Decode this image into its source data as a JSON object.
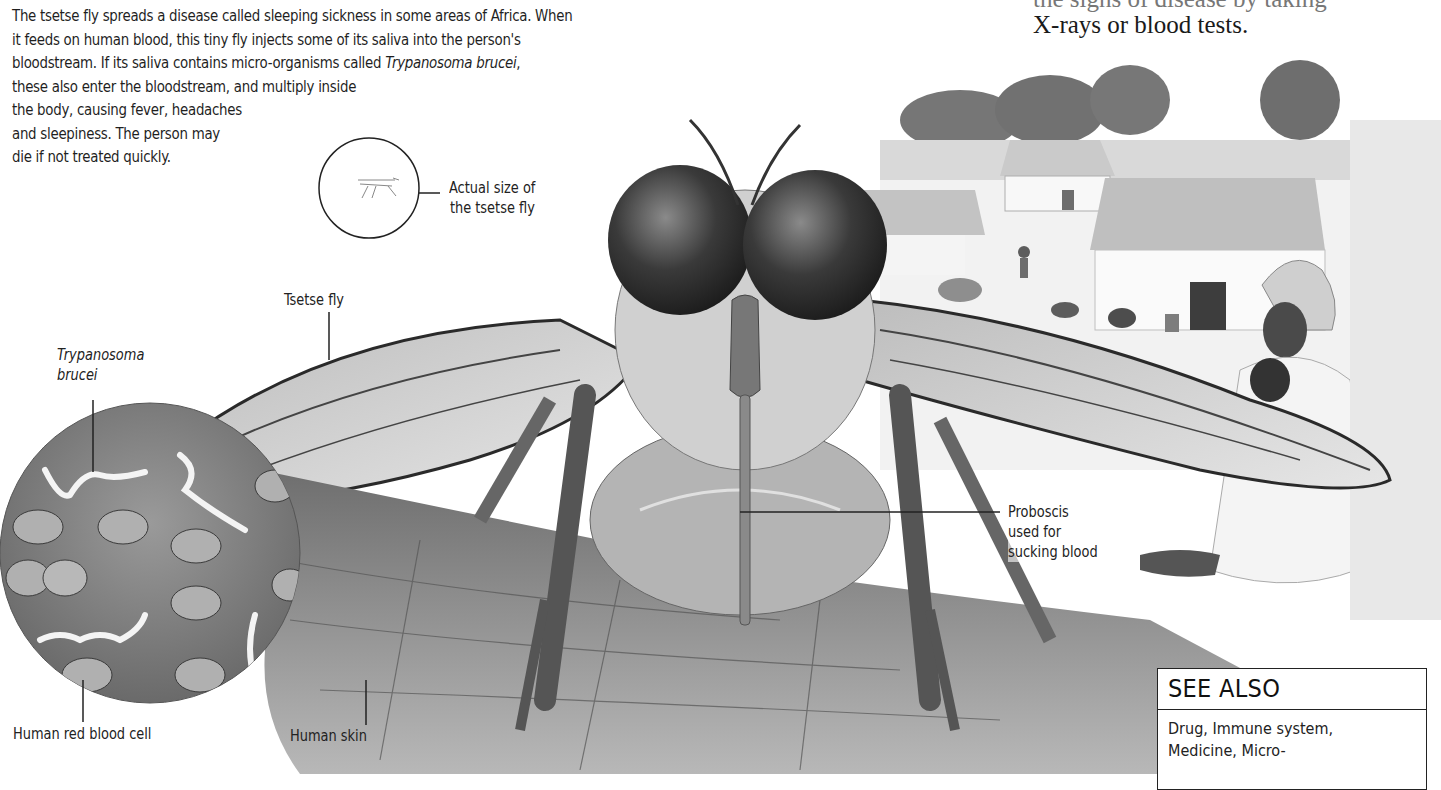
{
  "intro_paragraph": {
    "lines": [
      "The tsetse fly spreads a disease called sleeping sickness in some areas of Africa. When",
      "it feeds on human blood, this tiny fly injects some of its saliva into the person's",
      "bloodstream. If its saliva contains micro-organisms called ",
      "these also enter the bloodstream, and multiply inside",
      "the body, causing fever, headaches",
      "and sleepiness. The person may",
      "die if not treated quickly."
    ],
    "italic_term": "Trypanosoma brucei",
    "italic_suffix": ","
  },
  "side_text": {
    "line_partial": "the signs of disease by taking",
    "line_last": "X-rays or blood tests."
  },
  "labels": {
    "actual_size_1": "Actual size of",
    "actual_size_2": "the tsetse fly",
    "tsetse_fly": "Tsetse fly",
    "trypanosoma_1": "Trypanosoma",
    "trypanosoma_2": "brucei",
    "proboscis_1": "Proboscis",
    "proboscis_2": "used for",
    "proboscis_3": "sucking blood",
    "red_blood_cell": "Human red blood cell",
    "human_skin": "Human skin"
  },
  "see_also": {
    "heading": "SEE ALSO",
    "line1": "Drug, Immune system,",
    "line2": "Medicine, Micro-"
  },
  "colors": {
    "text": "#1f1f1f",
    "background": "#ffffff",
    "illustration_dark": "#3a3a3a",
    "illustration_mid": "#8a8a8a",
    "illustration_light": "#d6d6d6"
  }
}
